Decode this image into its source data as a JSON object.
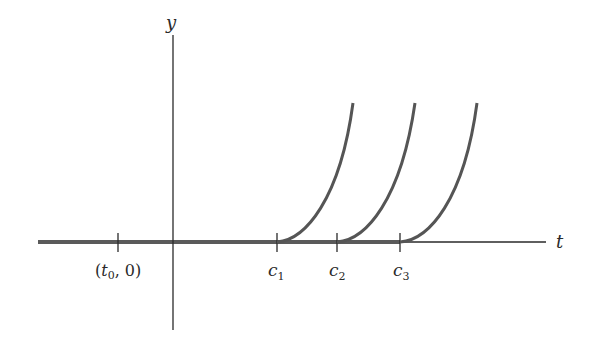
{
  "diagram": {
    "axes": {
      "x_label": "t",
      "y_label": "y"
    },
    "ticks": [
      {
        "id": "t0",
        "label_open": "(",
        "label_var": "t",
        "label_sub": "0",
        "label_close": ", 0)"
      },
      {
        "id": "c1",
        "label_var": "c",
        "label_sub": "1"
      },
      {
        "id": "c2",
        "label_var": "c",
        "label_sub": "2"
      },
      {
        "id": "c3",
        "label_var": "c",
        "label_sub": "3"
      }
    ],
    "curves": [
      {
        "name": "solution-curve-c1",
        "starts_at": "c1"
      },
      {
        "name": "solution-curve-c2",
        "starts_at": "c2"
      },
      {
        "name": "solution-curve-c3",
        "starts_at": "c3"
      }
    ],
    "colors": {
      "axis": "#2a2a2a",
      "curve": "#555555",
      "thick_line": "#5a5a5a"
    }
  }
}
